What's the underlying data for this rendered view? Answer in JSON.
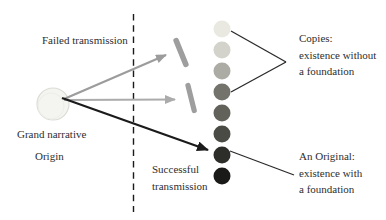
{
  "diagram": {
    "labels": {
      "failed_transmission": "Failed transmission",
      "grand_narrative": "Grand narrative",
      "origin": "Origin",
      "successful_transmission": "Successful\ntransmission",
      "copies": "Copies:\nexistence without\na foundation",
      "original": "An Original:\nexistence with\na foundation"
    },
    "colors": {
      "background": "#ffffff",
      "text": "#2e2e2e",
      "dashed_line": "#1a1a1a",
      "arrow_failed": "#9c9c9c",
      "arrow_blocked": "#ababab",
      "arrow_successful": "#1b1b1b",
      "barrier": "#9e9e9e",
      "pointer_line": "#2a2a2a",
      "origin_blob_fill": "#f4f4f1",
      "origin_blob_edge": "#dcdcd6"
    },
    "copies_circles": [
      "#e9e9e1",
      "#d3d3cb",
      "#acaca4",
      "#73736c",
      "#62625b",
      "#4b4b45",
      "#2d2d2a",
      "#1a1a18"
    ]
  }
}
